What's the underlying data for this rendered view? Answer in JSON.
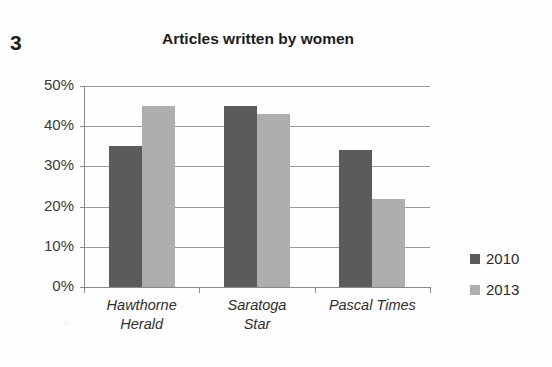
{
  "question_number": "3",
  "legend": {
    "position": "right",
    "entries": [
      {
        "label": "2010",
        "color": "#5b5b5b"
      },
      {
        "label": "2013",
        "color": "#aeaeae"
      }
    ]
  },
  "axis": {
    "y_ticks": [
      "50%",
      "40%",
      "30%",
      "20%",
      "10%",
      "0%"
    ]
  },
  "chart_data": {
    "type": "bar",
    "title": "Articles written by women",
    "xlabel": "",
    "ylabel": "",
    "ylim": [
      0,
      50
    ],
    "ytick_values": [
      50,
      40,
      30,
      20,
      10,
      0
    ],
    "ytick_labels": [
      "50%",
      "40%",
      "30%",
      "20%",
      "10%",
      "0%"
    ],
    "grid": true,
    "legend_position": "right",
    "value_format": "percent",
    "categories": [
      "Hawthorne Herald",
      "Saratoga Star",
      "Pascal Times"
    ],
    "category_lines": [
      [
        "Hawthorne",
        "Herald"
      ],
      [
        "Saratoga",
        "Star"
      ],
      [
        "Pascal Times",
        ""
      ]
    ],
    "series": [
      {
        "name": "2010",
        "color": "#5b5b5b",
        "values": [
          35,
          45,
          34
        ]
      },
      {
        "name": "2013",
        "color": "#aeaeae",
        "values": [
          45,
          43,
          22
        ]
      }
    ]
  }
}
